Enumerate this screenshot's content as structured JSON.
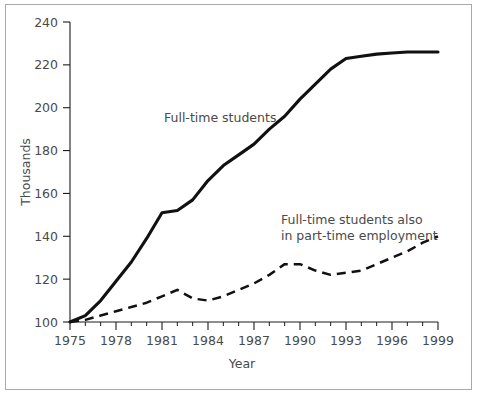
{
  "chart_data": {
    "type": "line",
    "title": "",
    "xlabel": "Year",
    "ylabel": "Thousands",
    "xlim": [
      1975,
      1999
    ],
    "ylim": [
      100,
      240
    ],
    "ytick_step": 20,
    "xtick_step": 3,
    "xtick_minor_step": 1,
    "grid": false,
    "legend_position": "inline-annotations",
    "x": [
      1975,
      1976,
      1977,
      1978,
      1979,
      1980,
      1981,
      1982,
      1983,
      1984,
      1985,
      1986,
      1987,
      1988,
      1989,
      1990,
      1991,
      1992,
      1993,
      1994,
      1995,
      1996,
      1997,
      1998,
      1999
    ],
    "xtick_labels": [
      "1975",
      "1978",
      "1981",
      "1984",
      "1987",
      "1990",
      "1993",
      "1996",
      "1999"
    ],
    "ytick_labels": [
      "100",
      "120",
      "140",
      "160",
      "180",
      "200",
      "220",
      "240"
    ],
    "series": [
      {
        "name": "Full-time students",
        "style": "solid",
        "label_line1": "Full-time students",
        "values": [
          100,
          103,
          110,
          119,
          128,
          139,
          151,
          152,
          157,
          166,
          173,
          178,
          183,
          190,
          196,
          204,
          211,
          218,
          223,
          224,
          225,
          225.5,
          226,
          226,
          226
        ]
      },
      {
        "name": "Full-time students also in part-time employment",
        "style": "dashed",
        "label_line1": "Full-time students also",
        "label_line2": "in part-time employment",
        "values": [
          100,
          101,
          103,
          105,
          107,
          109,
          112,
          115,
          111,
          110,
          112,
          115,
          118,
          122,
          127,
          127,
          124,
          122,
          123,
          124,
          127,
          130,
          133,
          137,
          140
        ]
      }
    ]
  },
  "annotations": {
    "solid_label": "Full-time students",
    "dashed_label_line1": "Full-time students also",
    "dashed_label_line2": "in part-time employment"
  },
  "axes": {
    "y_title": "Thousands",
    "x_title": "Year"
  }
}
